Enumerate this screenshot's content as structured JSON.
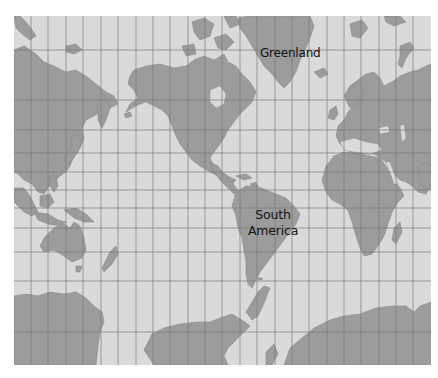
{
  "map": {
    "projection": "Mercator",
    "labels": {
      "greenland": "Greenland",
      "south_america_line1": "South",
      "south_america_line2": "America"
    },
    "colors": {
      "ocean": "#dadada",
      "land": "#9c9c9c",
      "gridline": "#7a7a7a",
      "label_text": "#111111"
    },
    "grid": {
      "meridian_count": 23,
      "parallel_count": 11
    }
  }
}
